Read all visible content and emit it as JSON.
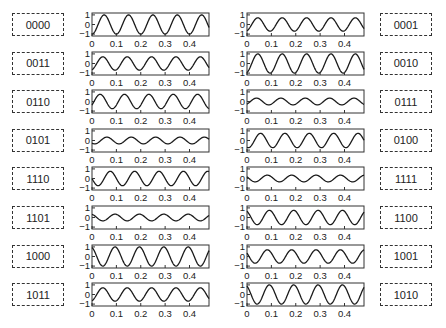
{
  "chart_data": {
    "type": "line",
    "title": "",
    "xlabel": "",
    "ylabel": "",
    "xlim": [
      0,
      0.48
    ],
    "ylim": [
      -1.2,
      1.2
    ],
    "x_ticks": [
      "0",
      "0.1",
      "0.2",
      "0.3",
      "0.4"
    ],
    "y_ticks": [
      "1",
      "0",
      "−1"
    ],
    "frequency_hz": 10,
    "panels": [
      {
        "label": "0000",
        "side": "left",
        "row": 0,
        "amplitude": 1.0,
        "phase_deg": 180
      },
      {
        "label": "0001",
        "side": "right",
        "row": 0,
        "amplitude": 0.7,
        "phase_deg": 200
      },
      {
        "label": "0011",
        "side": "left",
        "row": 1,
        "amplitude": 0.7,
        "phase_deg": 200
      },
      {
        "label": "0010",
        "side": "right",
        "row": 1,
        "amplitude": 1.0,
        "phase_deg": 200
      },
      {
        "label": "0110",
        "side": "left",
        "row": 2,
        "amplitude": 0.75,
        "phase_deg": 240
      },
      {
        "label": "0111",
        "side": "right",
        "row": 2,
        "amplitude": 0.35,
        "phase_deg": 220
      },
      {
        "label": "0101",
        "side": "left",
        "row": 3,
        "amplitude": 0.35,
        "phase_deg": 140
      },
      {
        "label": "0100",
        "side": "right",
        "row": 3,
        "amplitude": 0.75,
        "phase_deg": 160
      },
      {
        "label": "1110",
        "side": "left",
        "row": 4,
        "amplitude": 0.75,
        "phase_deg": 90
      },
      {
        "label": "1111",
        "side": "right",
        "row": 4,
        "amplitude": 0.35,
        "phase_deg": 60
      },
      {
        "label": "1101",
        "side": "left",
        "row": 5,
        "amplitude": 0.35,
        "phase_deg": 20
      },
      {
        "label": "1100",
        "side": "right",
        "row": 5,
        "amplitude": 0.75,
        "phase_deg": 30
      },
      {
        "label": "1000",
        "side": "left",
        "row": 6,
        "amplitude": 1.0,
        "phase_deg": 20
      },
      {
        "label": "1001",
        "side": "right",
        "row": 6,
        "amplitude": 0.7,
        "phase_deg": 60
      },
      {
        "label": "1011",
        "side": "left",
        "row": 7,
        "amplitude": 0.7,
        "phase_deg": 200
      },
      {
        "label": "1010",
        "side": "right",
        "row": 7,
        "amplitude": 1.0,
        "phase_deg": 30
      }
    ],
    "grid": false,
    "legend": "none"
  },
  "colors": {
    "line": "#1a1a1a",
    "axes": "#333333",
    "label_border": "#333333"
  }
}
